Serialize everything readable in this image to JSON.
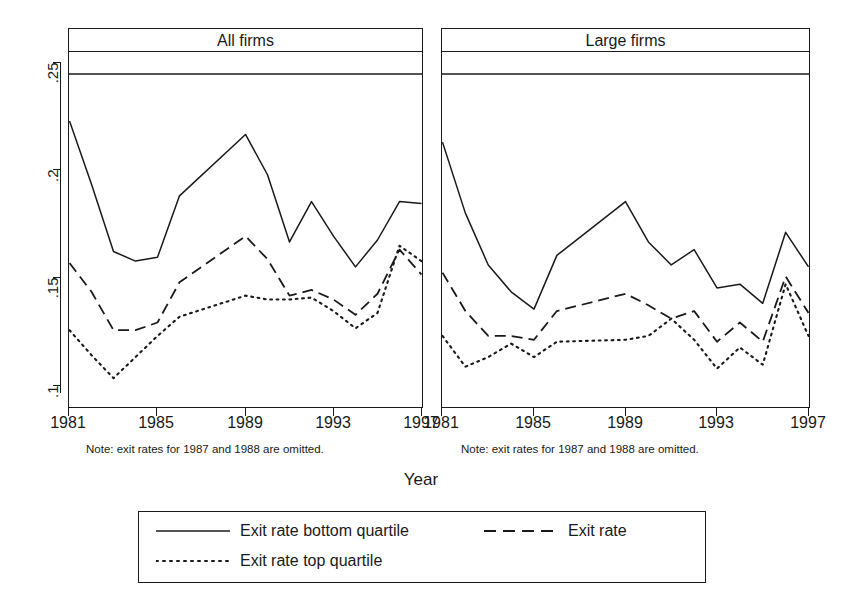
{
  "figure": {
    "xlabel": "Year",
    "note": "Note: exit rates for 1987 and 1988 are omitted."
  },
  "axis": {
    "ytick_labels": [
      ".25",
      ".2",
      ".15",
      ".1"
    ],
    "ytick_values": [
      0.25,
      0.2,
      0.15,
      0.1
    ],
    "xtick_labels": [
      "1981",
      "1985",
      "1989",
      "1993",
      "1997"
    ],
    "xtick_values": [
      1981,
      1985,
      1989,
      1993,
      1997
    ]
  },
  "panels": [
    {
      "title": "All firms"
    },
    {
      "title": "Large firms"
    }
  ],
  "legend": {
    "entries": [
      {
        "label": "Exit rate bottom quartile",
        "style": "solid"
      },
      {
        "label": "Exit rate",
        "style": "dashed"
      },
      {
        "label": "Exit rate top quartile",
        "style": "dotted"
      }
    ]
  },
  "chart_data": {
    "type": "line",
    "title": "",
    "xlabel": "Year",
    "ylabel": "",
    "xlim": [
      1981,
      1997
    ],
    "ylim": [
      0.085,
      0.258
    ],
    "grid": false,
    "legend_position": "bottom",
    "note": "Note: exit rates for 1987 and 1988 are omitted.",
    "panels": [
      {
        "title": "All firms",
        "x": [
          1981,
          1982,
          1983,
          1984,
          1985,
          1986,
          1989,
          1990,
          1991,
          1992,
          1993,
          1994,
          1995,
          1996,
          1997
        ],
        "series": [
          {
            "name": "Exit rate bottom quartile",
            "style": "solid",
            "values": [
              0.2335,
              0.2005,
              0.1655,
              0.1605,
              0.1625,
              0.1945,
              0.2265,
              0.2055,
              0.1705,
              0.1915,
              0.1735,
              0.1575,
              0.1715,
              0.1915,
              0.1905
            ]
          },
          {
            "name": "Exit rate",
            "style": "dashed",
            "values": [
              0.1595,
              0.1445,
              0.1245,
              0.1245,
              0.1285,
              0.1495,
              0.1735,
              0.1615,
              0.1425,
              0.1455,
              0.1405,
              0.1325,
              0.1435,
              0.1665,
              0.1535
            ]
          },
          {
            "name": "Exit rate top quartile",
            "style": "dotted",
            "values": [
              0.1245,
              0.1115,
              0.0995,
              0.1105,
              0.1215,
              0.1315,
              0.1425,
              0.1405,
              0.1405,
              0.1415,
              0.1345,
              0.1255,
              0.1335,
              0.1685,
              0.1605
            ]
          }
        ]
      },
      {
        "title": "Large firms",
        "x": [
          1981,
          1982,
          1983,
          1984,
          1985,
          1986,
          1989,
          1990,
          1991,
          1992,
          1993,
          1994,
          1995,
          1996,
          1997
        ],
        "series": [
          {
            "name": "Exit rate bottom quartile",
            "style": "solid",
            "values": [
              0.2225,
              0.1855,
              0.1585,
              0.1445,
              0.1355,
              0.1635,
              0.1915,
              0.1705,
              0.1585,
              0.1665,
              0.1465,
              0.1485,
              0.1385,
              0.1755,
              0.1575
            ]
          },
          {
            "name": "Exit rate",
            "style": "dashed",
            "values": [
              0.1545,
              0.1345,
              0.1215,
              0.1215,
              0.1195,
              0.1345,
              0.1435,
              0.1375,
              0.1305,
              0.1345,
              0.1185,
              0.1285,
              0.1185,
              0.1525,
              0.1335
            ]
          },
          {
            "name": "Exit rate top quartile",
            "style": "dotted",
            "values": [
              0.1215,
              0.1055,
              0.1105,
              0.1175,
              0.1105,
              0.1185,
              0.1195,
              0.1215,
              0.1305,
              0.1195,
              0.1045,
              0.1155,
              0.1065,
              0.1485,
              0.1215
            ]
          }
        ]
      }
    ]
  }
}
